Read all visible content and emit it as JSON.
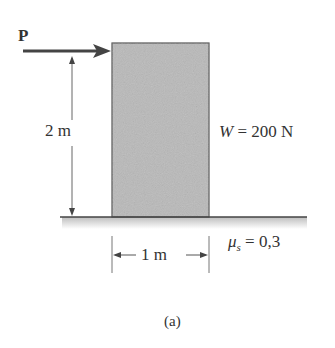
{
  "diagram": {
    "force_label": "P",
    "height_label": "2 m",
    "weight_label_symbol": "W",
    "weight_label_value": "= 200 N",
    "width_label": "1 m",
    "friction_symbol": "μ",
    "friction_subscript": "s",
    "friction_value": "= 0,3",
    "caption": "(a)",
    "colors": {
      "block_fill": "#b9b9b9",
      "block_stroke": "#555555",
      "arrow": "#444444",
      "ground_shade": "#cfcfcf",
      "line": "#555555"
    }
  }
}
